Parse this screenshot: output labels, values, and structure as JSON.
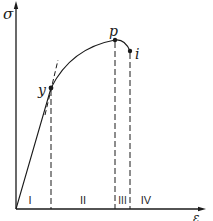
{
  "diagram": {
    "type": "stress-strain-curve",
    "axes": {
      "y_label": "σ",
      "x_label": "ε"
    },
    "points": [
      {
        "id": "y",
        "label": "y",
        "x": 51,
        "y": 88
      },
      {
        "id": "p",
        "label": "p",
        "x": 115,
        "y": 40
      },
      {
        "id": "i",
        "label": "i",
        "x": 130,
        "y": 51
      }
    ],
    "regions": [
      {
        "label": "I",
        "x": 30
      },
      {
        "label": "II",
        "x": 83
      },
      {
        "label": "III",
        "x": 122
      },
      {
        "label": "IV",
        "x": 146
      }
    ],
    "colors": {
      "line": "#1a1a1a",
      "background": "#ffffff"
    }
  }
}
